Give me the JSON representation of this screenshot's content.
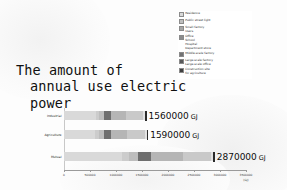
{
  "title": {
    "line1": "The amount of",
    "line2": "annual use electric power"
  },
  "legend": {
    "items": [
      {
        "label": "Residence",
        "color": "#d9d9d9"
      },
      {
        "label": "Public street light",
        "color": "#bfbfbf"
      },
      {
        "label": "Small factory\nUsers",
        "color": "#a6a6a6"
      },
      {
        "label": "Office\nSchool\nHospital\nDepartment store",
        "color": "#8c8c8c"
      },
      {
        "label": "Middle-scale factory",
        "color": "#737373"
      },
      {
        "label": "Large-scale factory\nLarge-scale office",
        "color": "#595959"
      },
      {
        "label": "Construction site\nfor agriculture",
        "color": "#404040"
      }
    ]
  },
  "chart_data": {
    "type": "bar",
    "orientation": "horizontal",
    "stacked": true,
    "title": "The amount of annual use electric power",
    "xlabel": "(GJ)",
    "ylabel": "",
    "categories": [
      "Industrial",
      "Agriculture",
      "Mutual"
    ],
    "xlim": [
      0,
      3500000
    ],
    "xticks": [
      0,
      500000,
      1000000,
      1500000,
      2000000,
      2500000,
      3000000,
      3500000
    ],
    "xticklabels": [
      "0",
      "500000",
      "1000000",
      "1500000",
      "2000000",
      "2500000",
      "3000000",
      "3500000"
    ],
    "grid": false,
    "legend_position": "top-right",
    "totals": [
      1560000,
      1590000,
      2870000
    ],
    "total_labels": [
      "1560000",
      "1590000",
      "2870000"
    ],
    "unit": "GJ",
    "series": [
      {
        "name": "Residence",
        "color": "#d9d9d9",
        "values": [
          620000,
          600000,
          1120000
        ]
      },
      {
        "name": "Public street light",
        "color": "#cccccc",
        "values": [
          60000,
          70000,
          130000
        ]
      },
      {
        "name": "Small factory",
        "color": "#bdbdbd",
        "values": [
          90000,
          95000,
          180000
        ]
      },
      {
        "name": "Office",
        "color": "#6e6e6e",
        "values": [
          130000,
          135000,
          250000
        ]
      },
      {
        "name": "Middle-scale factory",
        "color": "#b5b5b5",
        "values": [
          300000,
          320000,
          600000
        ]
      },
      {
        "name": "Large-scale factory",
        "color": "#c9c9c9",
        "values": [
          320000,
          330000,
          540000
        ]
      },
      {
        "name": "Construction site",
        "color": "#e2e2e2",
        "values": [
          40000,
          40000,
          50000
        ]
      }
    ]
  }
}
